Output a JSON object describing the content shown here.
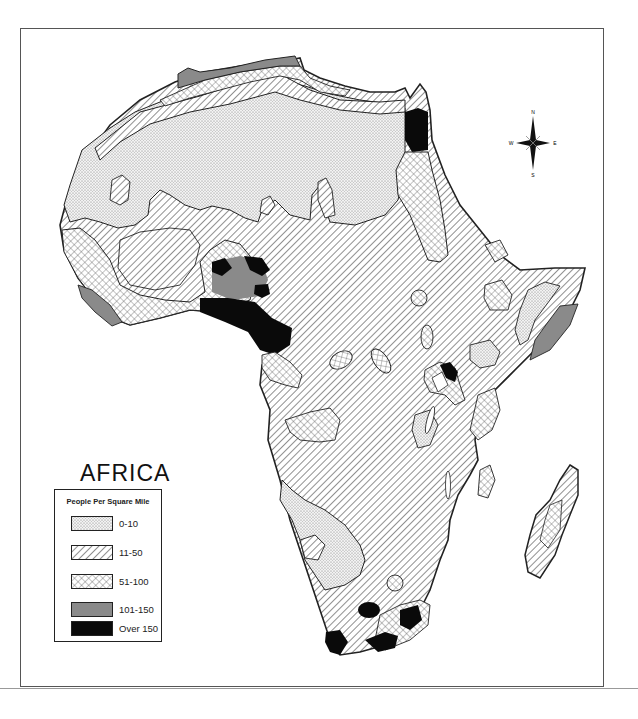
{
  "map": {
    "title": "AFRICA",
    "legend": {
      "heading": "People Per Square Mile",
      "items": [
        {
          "label": "0-10",
          "pattern": "dots"
        },
        {
          "label": "11-50",
          "pattern": "diagonal-hatch"
        },
        {
          "label": "51-100",
          "pattern": "cross-hatch"
        },
        {
          "label": "101-150",
          "pattern": "gray-fill"
        },
        {
          "label": "Over 150",
          "pattern": "black-fill"
        }
      ]
    },
    "compass": {
      "n": "N",
      "s": "S",
      "e": "E",
      "w": "W"
    },
    "colors": {
      "gray": "#8a8a8a",
      "black": "#0a0a0a",
      "outline": "#222222"
    }
  }
}
